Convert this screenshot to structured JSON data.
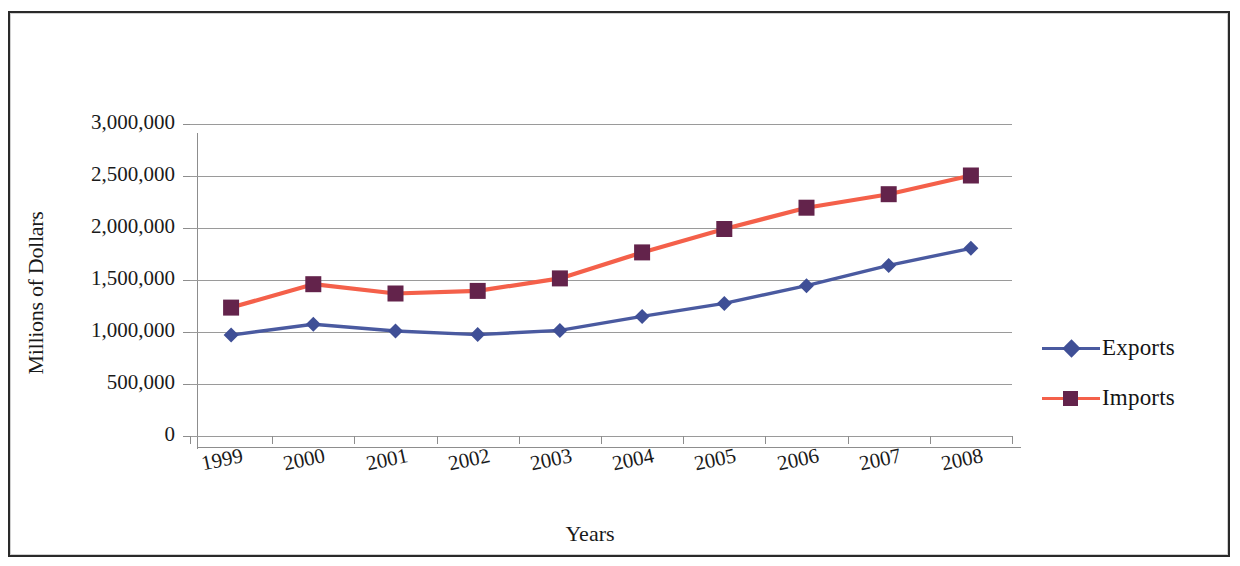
{
  "chart_data": {
    "type": "line",
    "title": "",
    "xlabel": "Years",
    "ylabel": "Millions of Dollars",
    "categories": [
      "1999",
      "2000",
      "2001",
      "2002",
      "2003",
      "2004",
      "2005",
      "2006",
      "2007",
      "2008"
    ],
    "series": [
      {
        "name": "Exports",
        "color": "#4a5aa0",
        "marker": "diamond",
        "marker_color": "#3f4f96",
        "values": [
          970000,
          1075000,
          1010000,
          975000,
          1015000,
          1150000,
          1275000,
          1445000,
          1640000,
          1805000
        ]
      },
      {
        "name": "Imports",
        "color": "#f4604a",
        "marker": "square",
        "marker_color": "#63234b",
        "values": [
          1235000,
          1460000,
          1370000,
          1395000,
          1515000,
          1765000,
          1990000,
          2195000,
          2325000,
          2505000
        ]
      }
    ],
    "ylim": [
      0,
      3000000
    ],
    "yticks": [
      0,
      500000,
      1000000,
      1500000,
      2000000,
      2500000,
      3000000
    ],
    "ytick_labels": [
      "0",
      "500,000",
      "1,000,000",
      "1,500,000",
      "2,000,000",
      "2,500,000",
      "3,000,000"
    ],
    "grid": true,
    "grid_axis": "y",
    "legend_position": "right",
    "legend_entries": [
      "Exports",
      "Imports"
    ]
  },
  "axes": {
    "y_title": "Millions of Dollars",
    "x_title": "Years"
  },
  "colors": {
    "exports_line": "#4a5aa0",
    "imports_line": "#f4604a",
    "marker_fill": "#63234b",
    "gridline": "#9a9a9a",
    "axis": "#8d8d8d",
    "border": "#2a2a2a",
    "text": "#1a1a1a",
    "background": "#ffffff"
  }
}
